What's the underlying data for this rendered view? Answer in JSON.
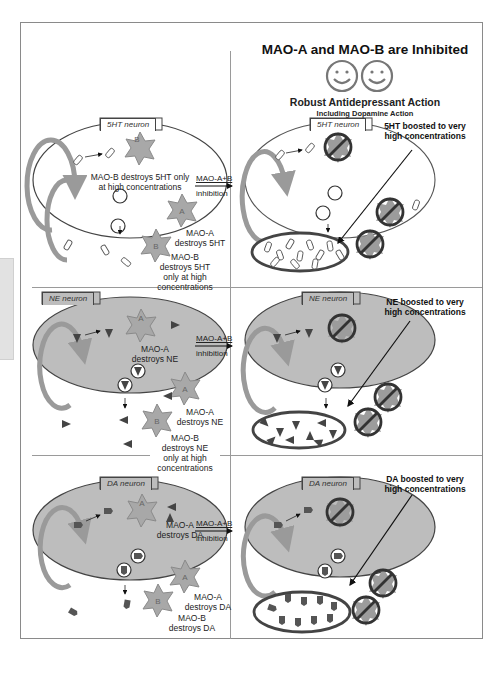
{
  "header": {
    "title": "MAO-A and MAO-B are Inhibited",
    "emoji": [
      "smiley-face",
      "smiley-face"
    ],
    "subtitle": "Robust Antidepressant Action",
    "subsubtitle": "Including Dopamine Action"
  },
  "colors": {
    "frame": "#8a8a8a",
    "neuron_grey_fill": "#bdbdbd",
    "neuron_white_fill": "#ffffff",
    "enzyme_fill": "#a8a8a8",
    "recycle_arrow": "#9a9a9a",
    "transmitter_dark": "#4a4a4a"
  },
  "panels": [
    {
      "id": "5ht",
      "left": {
        "neuron_label": "5HT neuron",
        "internal_text": [
          "MAO-B destroys 5HT only",
          "at high concentrations"
        ],
        "extracellular_labels": [
          [
            "MAO-A",
            "destroys 5HT"
          ],
          [
            "MAO-B",
            "destroys 5HT",
            "only at high",
            "concentrations"
          ]
        ]
      },
      "arrow": [
        "MAO-A+B",
        "inhibition"
      ],
      "right": {
        "neuron_label": "5HT neuron",
        "callout": [
          "5HT boosted to very",
          "high concentrations"
        ]
      }
    },
    {
      "id": "ne",
      "left": {
        "neuron_label": "NE neuron",
        "internal_text": [
          "MAO-A",
          "destroys NE"
        ],
        "extracellular_labels": [
          [
            "MAO-A",
            "destroys NE"
          ],
          [
            "MAO-B",
            "destroys NE",
            "only at high",
            "concentrations"
          ]
        ]
      },
      "arrow": [
        "MAO-A+B",
        "inhibition"
      ],
      "right": {
        "neuron_label": "NE neuron",
        "callout": [
          "NE boosted to very",
          "high concentrations"
        ]
      }
    },
    {
      "id": "da",
      "left": {
        "neuron_label": "DA neuron",
        "internal_text": [
          "MAO-A",
          "destroys DA"
        ],
        "extracellular_labels": [
          [
            "MAO-A",
            "destroys DA"
          ],
          [
            "MAO-B",
            "destroys DA"
          ]
        ]
      },
      "arrow": [
        "MAO-A+B",
        "inhibition"
      ],
      "right": {
        "neuron_label": "DA neuron",
        "callout": [
          "DA boosted to very",
          "high concentrations"
        ]
      }
    }
  ],
  "enzyme_letters": {
    "a": "A",
    "b": "B"
  }
}
